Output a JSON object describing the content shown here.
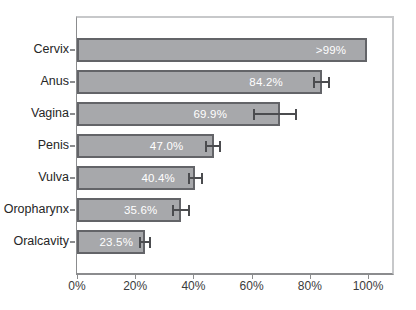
{
  "chart_data": {
    "type": "bar",
    "orientation": "horizontal",
    "title": "",
    "xlabel": "",
    "ylabel": "",
    "categories": [
      "Cervix",
      "Anus",
      "Vagina",
      "Penis",
      "Vulva",
      "Oropharynx",
      "Oralcavity"
    ],
    "values": [
      99.7,
      84.2,
      69.9,
      47.0,
      40.4,
      35.6,
      23.5
    ],
    "value_labels": [
      ">99%",
      "84.2%",
      "69.9%",
      "47.0%",
      "40.4%",
      "35.6%",
      "23.5%"
    ],
    "error_low": [
      null,
      81.0,
      60.5,
      44.0,
      38.0,
      32.5,
      21.3
    ],
    "error_high": [
      null,
      87.0,
      75.5,
      49.5,
      43.2,
      39.0,
      25.5
    ],
    "value_label_center_pct": [
      87.3,
      65.0,
      45.8,
      30.8,
      27.9,
      21.9,
      13.5
    ],
    "x_axis": {
      "tick_values": [
        0,
        20,
        40,
        60,
        80,
        100
      ],
      "tick_labels": [
        "0%",
        "20%",
        "40%",
        "60%",
        "80%",
        "100%"
      ],
      "range": [
        0,
        108.5
      ]
    },
    "grid": false,
    "legend": false,
    "colors": {
      "bar_fill": "#a7a8ab",
      "bar_border": "#636468",
      "error_bar": "#4b4c4f",
      "axis": "#8b8c8e",
      "frame": "#c7c8ca",
      "tick_label": "#3b3b3b",
      "category_label": "#262626",
      "value_label": "#ffffff",
      "background": "#ffffff"
    }
  }
}
